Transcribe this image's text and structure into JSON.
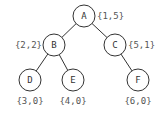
{
  "diagram": {
    "type": "binary-tree",
    "nodes": [
      {
        "id": "A",
        "label": "A",
        "annotation": "{1,5}",
        "cx": 84,
        "cy": 16,
        "ax": 97,
        "ay": 19,
        "anchor": "start"
      },
      {
        "id": "B",
        "label": "B",
        "annotation": "{2,2}",
        "cx": 54,
        "cy": 45,
        "ax": 42,
        "ay": 48,
        "anchor": "end"
      },
      {
        "id": "C",
        "label": "C",
        "annotation": "{5,1}",
        "cx": 115,
        "cy": 45,
        "ax": 128,
        "ay": 48,
        "anchor": "start"
      },
      {
        "id": "D",
        "label": "D",
        "annotation": "{3,0}",
        "cx": 30,
        "cy": 80,
        "ax": 30,
        "ay": 104,
        "anchor": "middle"
      },
      {
        "id": "E",
        "label": "E",
        "annotation": "{4,0}",
        "cx": 73,
        "cy": 80,
        "ax": 73,
        "ay": 104,
        "anchor": "middle"
      },
      {
        "id": "F",
        "label": "F",
        "annotation": "{6,0}",
        "cx": 138,
        "cy": 80,
        "ax": 138,
        "ay": 104,
        "anchor": "middle"
      }
    ],
    "edges": [
      {
        "from": "A",
        "to": "B"
      },
      {
        "from": "A",
        "to": "C"
      },
      {
        "from": "B",
        "to": "D"
      },
      {
        "from": "B",
        "to": "E"
      },
      {
        "from": "C",
        "to": "F"
      }
    ],
    "node_radius": 11,
    "colors": {
      "stroke": "#333333",
      "fill": "#ffffff",
      "text": "#333333"
    }
  }
}
